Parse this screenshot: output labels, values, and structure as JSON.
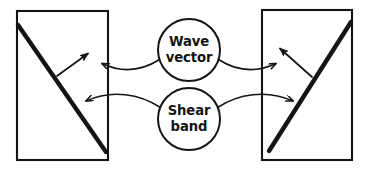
{
  "figure": {
    "type": "diagram",
    "background_color": "#ffffff",
    "ink_color": "#141414",
    "width": 375,
    "height": 171
  },
  "callouts": {
    "wave_vector": {
      "name": "Wave vector",
      "line1": "Wave",
      "line2": "vector",
      "center_x": 189,
      "center_y": 50,
      "radius": 31
    },
    "shear_band": {
      "name": "Shear band",
      "line1": "Shear",
      "line2": "band",
      "center_x": 189,
      "center_y": 119,
      "radius": 31
    }
  },
  "panels": [
    {
      "id": "left-panel",
      "name": "left specimen",
      "rect": {
        "x": 17,
        "y": 11,
        "width": 91,
        "height": 149
      },
      "shear_band": {
        "name": "shear band",
        "from_x": 18,
        "from_y": 25,
        "to_x": 106,
        "to_y": 152,
        "stroke_width": 4.2
      },
      "wave_vector": {
        "name": "wave vector",
        "from_x": 57,
        "from_y": 76,
        "to_x": 90,
        "to_y": 52
      }
    },
    {
      "id": "right-panel",
      "name": "right specimen",
      "rect": {
        "x": 262,
        "y": 10,
        "width": 90,
        "height": 150
      },
      "shear_band": {
        "name": "shear band",
        "from_x": 269,
        "from_y": 151,
        "to_x": 351,
        "to_y": 22,
        "stroke_width": 4.2
      },
      "wave_vector": {
        "name": "wave vector",
        "from_x": 312,
        "from_y": 77,
        "to_x": 278,
        "to_y": 47
      }
    }
  ],
  "leader_lines": [
    {
      "id": "wave-left",
      "name": "wave vector leader to left panel",
      "target": "left wave vector arrow"
    },
    {
      "id": "wave-right",
      "name": "wave vector leader to right panel",
      "target": "right wave vector arrow"
    },
    {
      "id": "shear-left",
      "name": "shear band leader to left panel",
      "target": "left shear band"
    },
    {
      "id": "shear-right",
      "name": "shear band leader to right panel",
      "target": "right shear band"
    }
  ]
}
